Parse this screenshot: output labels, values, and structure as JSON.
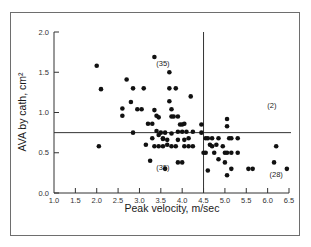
{
  "chart_data": {
    "type": "scatter",
    "title": "",
    "xlabel": "Peak velocity, m/sec",
    "ylabel": "AVA by cath, cm²",
    "xlim": [
      1.0,
      6.5
    ],
    "ylim": [
      0.0,
      2.0
    ],
    "xticks": [
      "1.0",
      "1.5",
      "2.0",
      "2.5",
      "3.0",
      "3.5",
      "4.0",
      "4.5",
      "5.0",
      "5.5",
      "6.0",
      "6.5"
    ],
    "yticks": [
      "0.0",
      "0.5",
      "1.0",
      "1.5",
      "2.0"
    ],
    "grid": false,
    "legend": null,
    "reference_lines": [
      {
        "orientation": "vertical",
        "x": 4.5
      },
      {
        "orientation": "horizontal",
        "y": 0.75
      }
    ],
    "annotations": [
      {
        "text": "(35)",
        "x": 3.55,
        "y": 1.58
      },
      {
        "text": "(2)",
        "x": 6.1,
        "y": 1.05
      },
      {
        "text": "(35)",
        "x": 3.55,
        "y": 0.28
      },
      {
        "text": "(28)",
        "x": 6.2,
        "y": 0.2
      }
    ],
    "series": [
      {
        "name": "patients",
        "points": [
          [
            2.0,
            1.58
          ],
          [
            2.1,
            1.29
          ],
          [
            2.05,
            0.58
          ],
          [
            2.7,
            1.41
          ],
          [
            2.8,
            1.13
          ],
          [
            2.95,
            1.04
          ],
          [
            3.05,
            1.04
          ],
          [
            2.6,
            1.05
          ],
          [
            2.6,
            0.96
          ],
          [
            2.85,
            1.3
          ],
          [
            3.1,
            1.3
          ],
          [
            3.35,
            1.69
          ],
          [
            3.35,
            1.03
          ],
          [
            3.4,
            0.96
          ],
          [
            3.45,
            0.94
          ],
          [
            3.2,
            0.86
          ],
          [
            3.3,
            0.86
          ],
          [
            2.85,
            0.75
          ],
          [
            3.5,
            0.75
          ],
          [
            3.7,
            1.5
          ],
          [
            3.7,
            1.3
          ],
          [
            3.85,
            1.3
          ],
          [
            3.7,
            1.14
          ],
          [
            3.75,
            1.04
          ],
          [
            3.4,
            0.77
          ],
          [
            3.45,
            0.72
          ],
          [
            3.3,
            0.68
          ],
          [
            3.55,
            0.68
          ],
          [
            3.75,
            0.95
          ],
          [
            3.8,
            0.95
          ],
          [
            3.9,
            0.95
          ],
          [
            3.95,
            0.85
          ],
          [
            4.0,
            0.85
          ],
          [
            4.05,
            0.86
          ],
          [
            4.2,
            1.2
          ],
          [
            4.45,
            0.85
          ],
          [
            3.6,
            0.75
          ],
          [
            3.75,
            0.74
          ],
          [
            3.9,
            0.76
          ],
          [
            4.0,
            0.76
          ],
          [
            4.1,
            0.76
          ],
          [
            4.25,
            0.76
          ],
          [
            4.45,
            0.75
          ],
          [
            3.55,
            0.67
          ],
          [
            3.65,
            0.66
          ],
          [
            3.9,
            0.66
          ],
          [
            4.05,
            0.66
          ],
          [
            4.15,
            0.68
          ],
          [
            3.35,
            0.58
          ],
          [
            3.45,
            0.58
          ],
          [
            3.55,
            0.58
          ],
          [
            3.65,
            0.6
          ],
          [
            3.75,
            0.58
          ],
          [
            3.85,
            0.58
          ],
          [
            4.05,
            0.58
          ],
          [
            4.15,
            0.58
          ],
          [
            4.25,
            0.58
          ],
          [
            3.25,
            0.4
          ],
          [
            3.15,
            0.6
          ],
          [
            3.9,
            0.38
          ],
          [
            4.0,
            0.38
          ],
          [
            3.6,
            0.3
          ],
          [
            4.55,
            0.68
          ],
          [
            4.6,
            0.68
          ],
          [
            4.7,
            0.68
          ],
          [
            4.85,
            0.68
          ],
          [
            4.65,
            0.6
          ],
          [
            4.7,
            0.58
          ],
          [
            4.8,
            0.6
          ],
          [
            4.95,
            0.58
          ],
          [
            5.1,
            0.68
          ],
          [
            5.15,
            0.68
          ],
          [
            5.3,
            0.68
          ],
          [
            5.05,
            0.92
          ],
          [
            5.05,
            0.83
          ],
          [
            4.5,
            0.5
          ],
          [
            4.55,
            0.5
          ],
          [
            4.75,
            0.5
          ],
          [
            5.0,
            0.5
          ],
          [
            5.05,
            0.5
          ],
          [
            5.15,
            0.5
          ],
          [
            5.3,
            0.5
          ],
          [
            4.85,
            0.42
          ],
          [
            5.0,
            0.38
          ],
          [
            5.15,
            0.3
          ],
          [
            4.6,
            0.28
          ],
          [
            5.05,
            0.22
          ],
          [
            5.55,
            0.3
          ],
          [
            5.65,
            0.3
          ],
          [
            6.15,
            0.38
          ],
          [
            6.2,
            0.58
          ],
          [
            6.45,
            0.3
          ]
        ]
      }
    ]
  }
}
